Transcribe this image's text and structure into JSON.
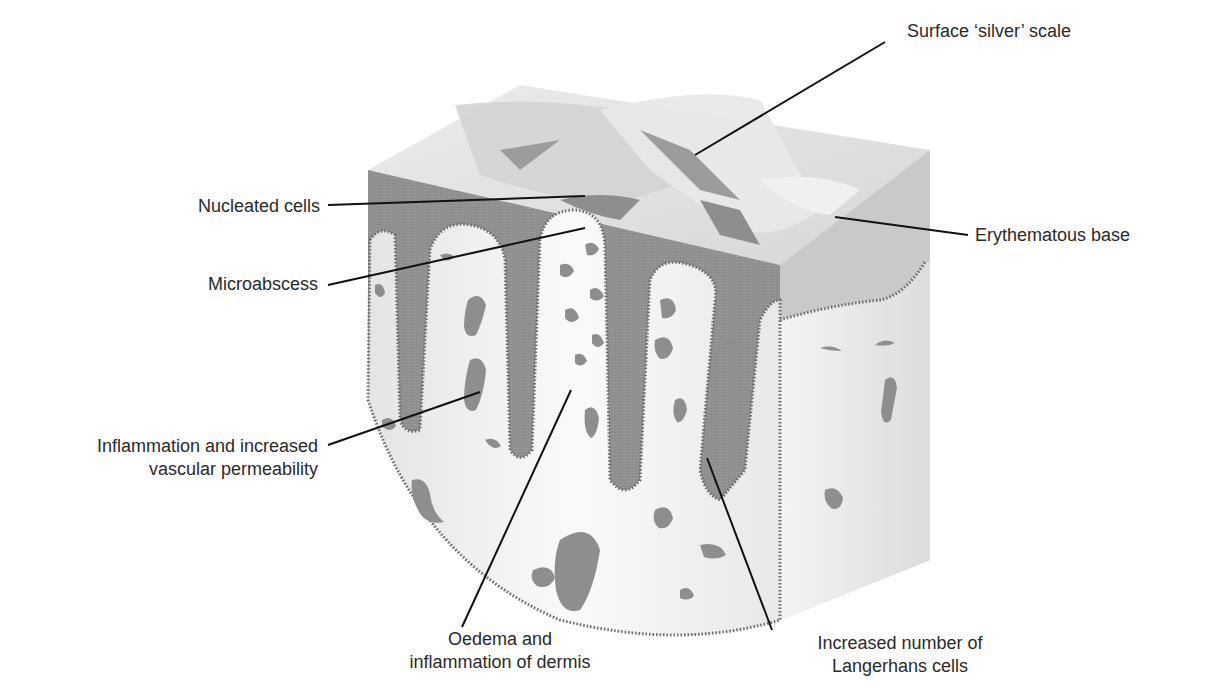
{
  "diagram": {
    "colors": {
      "epidermis": "#8e8e8e",
      "dermis": "#f2f2f2",
      "scale": "#e6e6e6",
      "leader_line": "#111111",
      "label_text": "#2a2a2a"
    }
  },
  "labels": {
    "surface_scale": "Surface ‘silver’ scale",
    "nucleated_cells": "Nucleated cells",
    "erythematous_base": "Erythematous base",
    "microabscess": "Microabscess",
    "inflammation": {
      "line1": "Inflammation and increased",
      "line2": "vascular permeability"
    },
    "oedema": {
      "line1": "Oedema and",
      "line2": "inflammation of dermis"
    },
    "langerhans": {
      "line1": "Increased number of",
      "line2": "Langerhans cells"
    }
  }
}
